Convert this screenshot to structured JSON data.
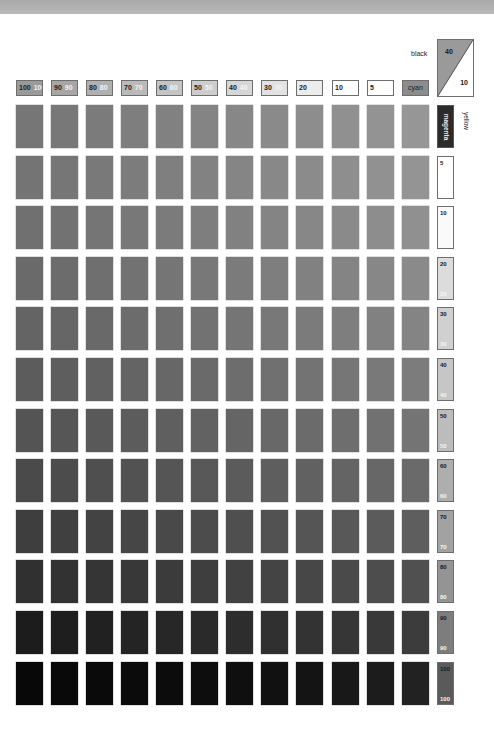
{
  "chart_data": {
    "type": "heatmap",
    "corner_key": {
      "black_label": "black",
      "black_value": "40",
      "second_value": "10"
    },
    "axis_labels": {
      "columns_axis": "cyan",
      "rows_axis": "yellow",
      "rows_ink": "magenta"
    },
    "column_headers": [
      {
        "k": "100",
        "y": "100"
      },
      {
        "k": "90",
        "y": "90"
      },
      {
        "k": "80",
        "y": "80"
      },
      {
        "k": "70",
        "y": "70"
      },
      {
        "k": "60",
        "y": "60"
      },
      {
        "k": "50",
        "y": "50"
      },
      {
        "k": "40",
        "y": "40"
      },
      {
        "k": "30",
        "y": "30"
      },
      {
        "k": "20",
        "y": ""
      },
      {
        "k": "10",
        "y": ""
      },
      {
        "k": "5",
        "y": ""
      },
      {
        "k": "cyan",
        "y": ""
      }
    ],
    "column_header_fills": [
      "#9a9a9a",
      "#a6a6a6",
      "#b0b0b0",
      "#bababa",
      "#c4c4c4",
      "#cdcdcd",
      "#d6d6d6",
      "#e2e2e2",
      "#ececec",
      "#ffffff",
      "#ffffff",
      "#8c8c8c"
    ],
    "row_headers": [
      {
        "k": "magenta",
        "y": ""
      },
      {
        "k": "5",
        "y": ""
      },
      {
        "k": "10",
        "y": ""
      },
      {
        "k": "20",
        "y": "20"
      },
      {
        "k": "30",
        "y": "30"
      },
      {
        "k": "40",
        "y": "40"
      },
      {
        "k": "50",
        "y": "50"
      },
      {
        "k": "60",
        "y": "60"
      },
      {
        "k": "70",
        "y": "70"
      },
      {
        "k": "80",
        "y": "80"
      },
      {
        "k": "90",
        "y": "90"
      },
      {
        "k": "100",
        "y": "100"
      }
    ],
    "row_header_fills": [
      "#2b2b2b",
      "#ffffff",
      "#fafafa",
      "#dcdcdc",
      "#d0d0d0",
      "#c6c6c6",
      "#bcbcbc",
      "#aeaeae",
      "#a2a2a2",
      "#949494",
      "#7d7d7d",
      "#5a5a5a"
    ],
    "grid_gray_values": [
      [
        118,
        120,
        123,
        126,
        129,
        132,
        135,
        138,
        141,
        144,
        147,
        150
      ],
      [
        116,
        118,
        121,
        124,
        127,
        130,
        133,
        136,
        139,
        142,
        145,
        148
      ],
      [
        112,
        114,
        117,
        120,
        123,
        126,
        129,
        132,
        135,
        138,
        141,
        144
      ],
      [
        106,
        108,
        111,
        114,
        117,
        120,
        123,
        126,
        129,
        132,
        135,
        138
      ],
      [
        100,
        102,
        105,
        108,
        111,
        114,
        117,
        120,
        123,
        126,
        129,
        132
      ],
      [
        92,
        94,
        97,
        100,
        103,
        106,
        109,
        112,
        115,
        118,
        121,
        124
      ],
      [
        84,
        86,
        89,
        92,
        95,
        98,
        101,
        104,
        107,
        110,
        113,
        116
      ],
      [
        74,
        76,
        79,
        82,
        85,
        88,
        91,
        94,
        97,
        100,
        103,
        106
      ],
      [
        62,
        64,
        67,
        70,
        73,
        76,
        79,
        82,
        85,
        88,
        91,
        94
      ],
      [
        48,
        50,
        53,
        56,
        59,
        62,
        65,
        68,
        71,
        74,
        77,
        80
      ],
      [
        28,
        30,
        33,
        36,
        39,
        42,
        45,
        48,
        51,
        54,
        57,
        60
      ],
      [
        8,
        9,
        10,
        11,
        12,
        13,
        15,
        17,
        20,
        24,
        28,
        34
      ]
    ],
    "layout": {
      "grid_rows": 12,
      "grid_cols": 12,
      "legend": "none",
      "grid": false
    }
  }
}
